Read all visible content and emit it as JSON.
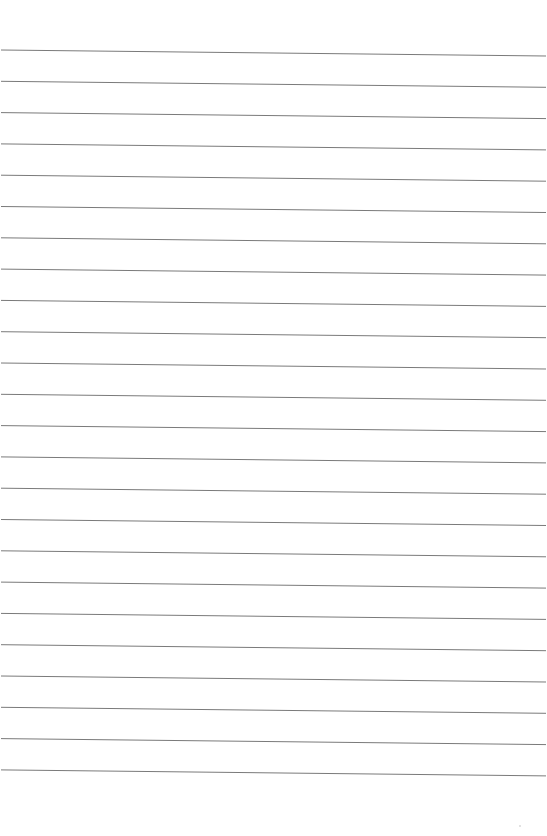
{
  "page": {
    "type": "lined-paper",
    "background": "#ffffff",
    "line_color": "#7a7a7a",
    "line_count": 24,
    "first_line_y_left": 50,
    "first_line_y_right": 56,
    "line_spacing": 31.3,
    "line_x_start": 1,
    "line_x_end": 546
  }
}
